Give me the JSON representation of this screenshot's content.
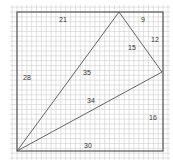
{
  "diagram": {
    "type": "geometry-grid",
    "colors": {
      "grid": "#cfcfcf",
      "square": "#555555",
      "triangle": "#555555",
      "label": "#333333"
    },
    "square": {
      "x": 17,
      "y": 12,
      "size": 146
    },
    "grid": {
      "x0": 10,
      "y0": 5,
      "x1": 170,
      "y1": 160,
      "step": 4.87
    },
    "triangle": {
      "vertices": [
        [
          119,
          12
        ],
        [
          162,
          72
        ],
        [
          17,
          151
        ]
      ]
    },
    "labels": [
      {
        "id": "top-left-segment",
        "text": "21",
        "x": 63,
        "y": 19
      },
      {
        "id": "top-right-segment",
        "text": "9",
        "x": 143,
        "y": 19
      },
      {
        "id": "right-upper-segment",
        "text": "12",
        "x": 155,
        "y": 39
      },
      {
        "id": "triangle-right-side",
        "text": "15",
        "x": 132,
        "y": 47
      },
      {
        "id": "left-side",
        "text": "28",
        "x": 27,
        "y": 77
      },
      {
        "id": "triangle-left-side",
        "text": "35",
        "x": 87,
        "y": 72
      },
      {
        "id": "triangle-bottom-side",
        "text": "34",
        "x": 91,
        "y": 100
      },
      {
        "id": "right-lower-segment",
        "text": "16",
        "x": 153,
        "y": 117
      },
      {
        "id": "bottom-side",
        "text": "30",
        "x": 88,
        "y": 145
      }
    ]
  }
}
